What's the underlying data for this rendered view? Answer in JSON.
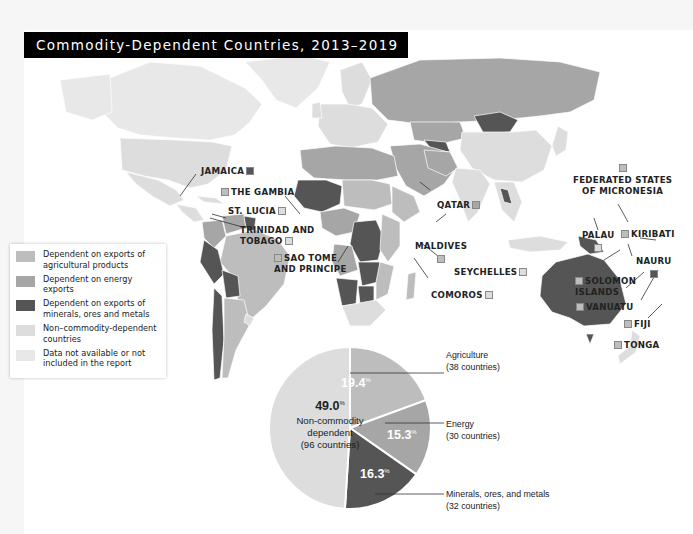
{
  "title": "Commodity-Dependent Countries, 2013–2019",
  "colors": {
    "agricultural": "#bdbdbd",
    "energy": "#a6a6a6",
    "minerals": "#555555",
    "non_commodity": "#dddddd",
    "no_data": "#e8e8e8",
    "water": "#ffffff"
  },
  "legend": {
    "items": [
      {
        "key": "agricultural",
        "label": "Dependent on exports of agricultural products"
      },
      {
        "key": "energy",
        "label": "Dependent on energy exports"
      },
      {
        "key": "minerals",
        "label": "Dependent on exports of minerals, ores and metals"
      },
      {
        "key": "non_commodity",
        "label": "Non–commodity-dependent countries"
      },
      {
        "key": "no_data",
        "label": "Data not available or not included in the report"
      }
    ]
  },
  "callouts": [
    {
      "name": "JAMAICA",
      "category": "minerals"
    },
    {
      "name": "THE GAMBIA",
      "category": "agricultural"
    },
    {
      "name": "ST. LUCIA",
      "category": "non_commodity"
    },
    {
      "name": "TRINIDAD AND TOBAGO",
      "category": "non_commodity"
    },
    {
      "name": "SAO TOME AND PRINCIPE",
      "category": "agricultural"
    },
    {
      "name": "QATAR",
      "category": "energy"
    },
    {
      "name": "MALDIVES",
      "category": "agricultural"
    },
    {
      "name": "SEYCHELLES",
      "category": "non_commodity"
    },
    {
      "name": "COMOROS",
      "category": "non_commodity"
    },
    {
      "name": "FEDERATED STATES OF MICRONESIA",
      "category": "agricultural"
    },
    {
      "name": "PALAU",
      "category": "non_commodity"
    },
    {
      "name": "KIRIBATI",
      "category": "agricultural"
    },
    {
      "name": "NAURU",
      "category": "minerals"
    },
    {
      "name": "SOLOMON ISLANDS",
      "category": "agricultural"
    },
    {
      "name": "VANUATU",
      "category": "agricultural"
    },
    {
      "name": "FIJI",
      "category": "agricultural"
    },
    {
      "name": "TONGA",
      "category": "agricultural"
    }
  ],
  "chart_data": [
    {
      "type": "map",
      "title": "Commodity-Dependent Countries, 2013–2019",
      "categories": [
        "Agricultural products",
        "Energy",
        "Minerals, ores and metals",
        "Non-commodity-dependent",
        "Data not available"
      ],
      "legend_position": "left"
    },
    {
      "type": "pie",
      "slices": [
        {
          "label": "Agriculture",
          "value": 19.4,
          "countries": 38,
          "caption": "(38 countries)",
          "key": "agricultural"
        },
        {
          "label": "Energy",
          "value": 15.3,
          "countries": 30,
          "caption": "(30 countries)",
          "key": "energy"
        },
        {
          "label": "Minerals, ores, and metals",
          "value": 16.3,
          "countries": 32,
          "caption": "(32 countries)",
          "key": "minerals"
        },
        {
          "label": "Non-commodity dependent",
          "value": 49.0,
          "countries": 96,
          "caption": "(96 countries)",
          "key": "non_commodity"
        }
      ],
      "unit": "%",
      "pct_labels": {
        "agriculture": "19.4",
        "energy": "15.3",
        "minerals": "16.3",
        "non_commodity": "49.0",
        "symbol": "%"
      },
      "non_commodity_text": [
        "Non-commodity",
        "dependent",
        "(96 countries)"
      ]
    }
  ]
}
